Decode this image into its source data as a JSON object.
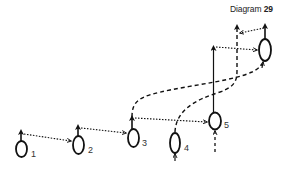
{
  "title": {
    "prefix": "Diagram",
    "number": "29"
  },
  "nodes": [
    {
      "id": "1",
      "label": "1",
      "cx": 21.5,
      "cy": 149,
      "rx": 5.5,
      "ry": 8
    },
    {
      "id": "2",
      "label": "2",
      "cx": 78.5,
      "cy": 145,
      "rx": 5.5,
      "ry": 9
    },
    {
      "id": "3",
      "label": "3",
      "cx": 133.5,
      "cy": 138,
      "rx": 5.5,
      "ry": 9
    },
    {
      "id": "4",
      "label": "4",
      "cx": 175,
      "cy": 143,
      "rx": 5,
      "ry": 10
    },
    {
      "id": "5",
      "label": "5",
      "cx": 215,
      "cy": 121,
      "rx": 6,
      "ry": 8.5
    },
    {
      "id": "6",
      "label": "",
      "cx": 265,
      "cy": 50,
      "rx": 6,
      "ry": 11
    }
  ],
  "edges": {
    "dotted": "strategy transfer",
    "dashed": "path",
    "solid": "main line"
  },
  "colors": {
    "stroke": "#111111",
    "label": "#333333"
  }
}
